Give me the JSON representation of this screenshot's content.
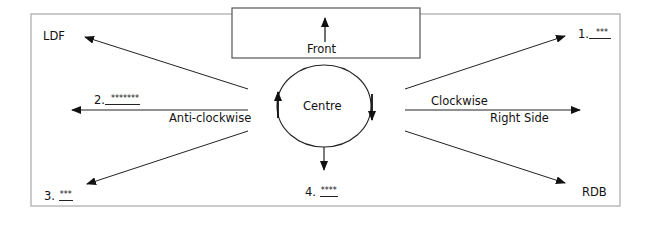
{
  "diagram": {
    "front_label": "Front",
    "centre_label": "Centre",
    "clockwise_label": "Clockwise",
    "anticlockwise_label": "Anti-clockwise",
    "right_side_label": "Right Side",
    "ldf_label": "LDF",
    "rdb_label": "RDB",
    "blanks": [
      {
        "number": "1.",
        "mask": "***"
      },
      {
        "number": "2.",
        "mask": "*******"
      },
      {
        "number": "3.",
        "mask": "***"
      },
      {
        "number": "4.",
        "mask": "****"
      }
    ],
    "colors": {
      "frame": "#a0a0a0",
      "lines": "#222222",
      "text": "#111111"
    }
  }
}
